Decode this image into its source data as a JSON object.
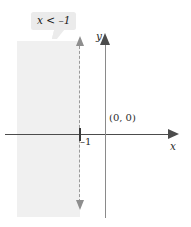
{
  "figure": {
    "callout_label": "x < –1",
    "axis_label_x": "x",
    "axis_label_y": "y",
    "origin_label": "(0, 0)",
    "tick_label": "–1",
    "colors": {
      "shade": "#f0f0f0",
      "axis": "#4c4c4c",
      "dashed_line": "#9a9a9a",
      "callout_background": "#ebebeb",
      "text": "#1a1a1a",
      "background": "#ffffff"
    }
  },
  "chart_data": {
    "type": "line",
    "title": "",
    "xlabel": "x",
    "ylabel": "y",
    "grid": false,
    "legend": null,
    "xlim": [
      -4,
      3
    ],
    "ylim": [
      -3,
      3
    ],
    "annotations": [
      {
        "text": "x < –1",
        "role": "callout",
        "target": "boundary-line"
      },
      {
        "text": "(0, 0)",
        "role": "point-label",
        "x": 0,
        "y": 0
      },
      {
        "text": "–1",
        "role": "tick-label",
        "x": -1,
        "y": 0
      }
    ],
    "series": [
      {
        "name": "boundary x = –1",
        "type": "vertical-line",
        "style": "dashed",
        "x": -1,
        "arrows": [
          "up",
          "down"
        ],
        "included": false
      },
      {
        "name": "solution region x < –1",
        "type": "shaded-halfplane",
        "direction": "left",
        "boundary_x": -1
      }
    ]
  }
}
